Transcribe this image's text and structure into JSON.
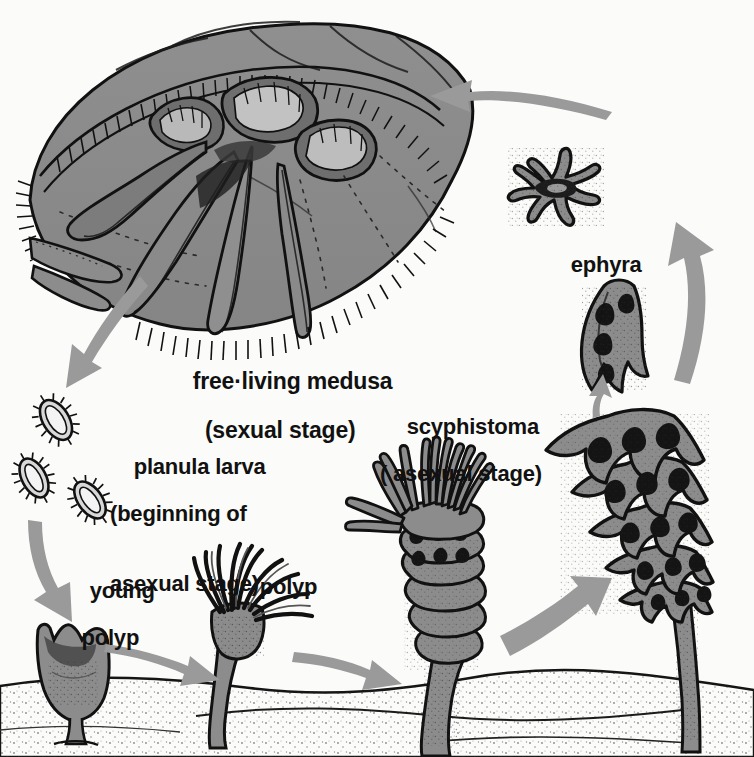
{
  "diagram": {
    "background_color": "#fbfbf9",
    "ink_color": "#111111",
    "fill_gray": "#8c8c8c",
    "arrow_color": "#9a9a9a"
  },
  "labels": {
    "medusa": {
      "line1": "free·living medusa",
      "line2": "(sexual stage)"
    },
    "planula": {
      "line1": "planula larva",
      "line2": "(beginning of",
      "line3": "asexual stage)"
    },
    "scyphistoma": {
      "line1": "scyphistoma",
      "line2": "( asexual stage)"
    },
    "ephyra": {
      "line1": "ephyra"
    },
    "young_polyp": {
      "line1": "young",
      "line2": "polyp"
    },
    "polyp": {
      "line1": "polyp"
    }
  },
  "stages": [
    {
      "id": "medusa",
      "name": "free-living medusa",
      "note": "sexual stage"
    },
    {
      "id": "planula",
      "name": "planula larva",
      "note": "beginning of asexual stage",
      "count": 3
    },
    {
      "id": "young-polyp",
      "name": "young polyp"
    },
    {
      "id": "polyp",
      "name": "polyp"
    },
    {
      "id": "scyphistoma",
      "name": "scyphistoma",
      "note": "asexual stage"
    },
    {
      "id": "strobila",
      "name": "strobila"
    },
    {
      "id": "ephyra-detaching",
      "name": "detaching ephyra"
    },
    {
      "id": "ephyra",
      "name": "ephyra"
    }
  ],
  "arrows": [
    {
      "id": "medusa-to-planula",
      "from": "medusa",
      "to": "planula",
      "direction": "down-left"
    },
    {
      "id": "planula-to-young-polyp",
      "from": "planula",
      "to": "young-polyp",
      "direction": "down"
    },
    {
      "id": "young-polyp-to-polyp",
      "from": "young-polyp",
      "to": "polyp",
      "direction": "right"
    },
    {
      "id": "polyp-to-scyphistoma",
      "from": "polyp",
      "to": "scyphistoma",
      "direction": "right"
    },
    {
      "id": "scyphistoma-to-strobila",
      "from": "scyphistoma",
      "to": "strobila",
      "direction": "up-right"
    },
    {
      "id": "strobila-to-ephyra-detaching",
      "from": "strobila",
      "to": "ephyra-detaching",
      "direction": "up"
    },
    {
      "id": "ephyra-detaching-to-ephyra",
      "from": "ephyra-detaching",
      "to": "ephyra",
      "direction": "up"
    },
    {
      "id": "ephyra-to-medusa",
      "from": "ephyra",
      "to": "medusa",
      "direction": "left"
    }
  ]
}
